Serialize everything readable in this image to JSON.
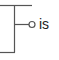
{
  "diagram": {
    "type": "tree-fragment",
    "colors": {
      "line": "#555555",
      "text": "#222222",
      "node_fill": "#ffffff"
    },
    "node": {
      "label": "is",
      "marker": "open-circle"
    }
  }
}
